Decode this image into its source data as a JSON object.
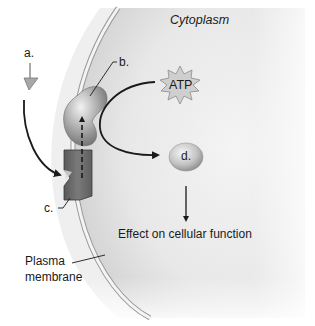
{
  "diagram": {
    "type": "cell-signaling-diagram",
    "region_label": "Cytoplasm",
    "labels": {
      "a": "a.",
      "b": "b.",
      "c": "c.",
      "d": "d.",
      "atp": "ATP",
      "effect": "Effect on cellular function",
      "membrane_line1": "Plasma",
      "membrane_line2": "membrane"
    },
    "colors": {
      "cytoplasm_light": "#f2f2f2",
      "cytoplasm_shade": "#cfcfcf",
      "membrane": "#e6e6e6",
      "receptor": "#6d6d6d",
      "protein_b": "#a9a9a9",
      "atp_star": "#c8c8c8",
      "molecule_d": "#b8b8b8",
      "arrow": "#1a1a1a"
    },
    "elements": [
      {
        "id": "a",
        "name": "signal-molecule",
        "shape": "triangle"
      },
      {
        "id": "b",
        "name": "membrane-protein",
        "shape": "kidney"
      },
      {
        "id": "c",
        "name": "receptor",
        "shape": "notched-block"
      },
      {
        "id": "atp",
        "name": "ATP",
        "shape": "starburst"
      },
      {
        "id": "d",
        "name": "second-messenger",
        "shape": "ellipse"
      }
    ],
    "flow": [
      "a binds c",
      "c activates b",
      "b converts ATP to d",
      "d produces effect on cellular function"
    ]
  }
}
